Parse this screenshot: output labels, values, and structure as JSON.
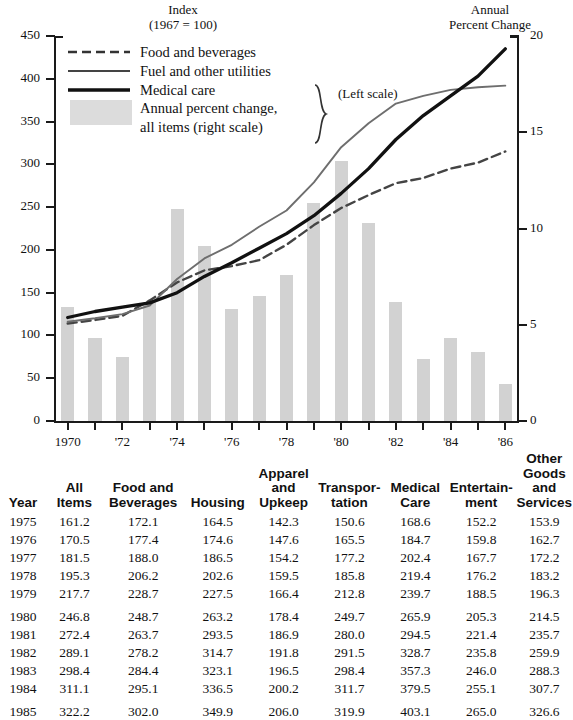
{
  "chart_data": {
    "type": "line",
    "title": "",
    "left_axis_title": "Index\n(1967 = 100)",
    "left_axis_title_line1": "Index",
    "left_axis_title_line2": "(1967 = 100)",
    "right_axis_title_line1": "Annual",
    "right_axis_title_line2": "Percent Change",
    "xlabel": "",
    "ylabel": "Index (1967 = 100)",
    "ylabel_right": "Annual Percent Change",
    "ylim": [
      0,
      450
    ],
    "ylim_right": [
      0,
      20
    ],
    "yticks": [
      0,
      50,
      100,
      150,
      200,
      250,
      300,
      350,
      400,
      450
    ],
    "yticks_right": [
      0,
      5,
      10,
      15,
      20
    ],
    "grid": false,
    "legend_position": "upper-left",
    "x": [
      1970,
      1971,
      1972,
      1973,
      1974,
      1975,
      1976,
      1977,
      1978,
      1979,
      1980,
      1981,
      1982,
      1983,
      1984,
      1985,
      1986
    ],
    "xtick_labels": [
      "1970",
      "",
      "'72",
      "",
      "'74",
      "",
      "'76",
      "",
      "'78",
      "",
      "'80",
      "",
      "'82",
      "",
      "'84",
      "",
      "'86"
    ],
    "series": [
      {
        "name": "Food and beverages",
        "style": "dashed",
        "color": "#444444",
        "scale": "left",
        "values": [
          114,
          118,
          123,
          141,
          162,
          176,
          181,
          188,
          206,
          229,
          249,
          264,
          278,
          284,
          295,
          302,
          315
        ]
      },
      {
        "name": "Fuel and other utilities",
        "style": "thin-solid",
        "color": "#6e6e6e",
        "scale": "left",
        "values": [
          116,
          120,
          125,
          135,
          166,
          190,
          206,
          227,
          246,
          279,
          320,
          348,
          371,
          380,
          387,
          390,
          392
        ]
      },
      {
        "name": "Medical care",
        "style": "thick-solid",
        "color": "#111111",
        "scale": "left",
        "values": [
          121,
          128,
          133,
          138,
          150,
          169,
          185,
          202,
          219,
          240,
          266,
          295,
          329,
          357,
          380,
          403,
          435
        ]
      },
      {
        "name": "Annual percent change, all items (right scale)",
        "style": "bar",
        "color": "#d2d2d2",
        "scale": "right",
        "values": [
          5.9,
          4.3,
          3.3,
          6.2,
          11.0,
          9.1,
          5.8,
          6.5,
          7.6,
          11.3,
          13.5,
          10.3,
          6.2,
          3.2,
          4.3,
          3.6,
          1.9
        ]
      }
    ],
    "legend": [
      {
        "label": "Food and beverages",
        "key": "dashed-line"
      },
      {
        "label": "Fuel and other utilities",
        "key": "thin-line"
      },
      {
        "label": "Medical care",
        "key": "thick-line"
      },
      {
        "label": "Annual percent change,",
        "key": "gray-swatch"
      },
      {
        "label": "all items (right scale)",
        "key": "gray-swatch-cont"
      }
    ],
    "legend_brace_label": "(Left scale)"
  },
  "table": {
    "headers": [
      "Year",
      "All\nItems",
      "Food and\nBeverages",
      "Housing",
      "Apparel\nand\nUpkeep",
      "Transpor-\ntation",
      "Medical\nCare",
      "Entertain-\nment",
      "Other\nGoods\nand Services"
    ],
    "headers_split": [
      [
        "",
        "",
        "Year"
      ],
      [
        "",
        "All",
        "Items"
      ],
      [
        "",
        "Food and",
        "Beverages"
      ],
      [
        "",
        "",
        "Housing"
      ],
      [
        "Apparel",
        "and",
        "Upkeep"
      ],
      [
        "",
        "Transpor-",
        "tation"
      ],
      [
        "",
        "Medical",
        "Care"
      ],
      [
        "",
        "Entertain-",
        "ment"
      ],
      [
        "Other",
        "Goods",
        "and Services"
      ]
    ],
    "rows": [
      [
        "1975",
        "161.2",
        "172.1",
        "164.5",
        "142.3",
        "150.6",
        "168.6",
        "152.2",
        "153.9"
      ],
      [
        "1976",
        "170.5",
        "177.4",
        "174.6",
        "147.6",
        "165.5",
        "184.7",
        "159.8",
        "162.7"
      ],
      [
        "1977",
        "181.5",
        "188.0",
        "186.5",
        "154.2",
        "177.2",
        "202.4",
        "167.7",
        "172.2"
      ],
      [
        "1978",
        "195.3",
        "206.2",
        "202.6",
        "159.5",
        "185.8",
        "219.4",
        "176.2",
        "183.2"
      ],
      [
        "1979",
        "217.7",
        "228.7",
        "227.5",
        "166.4",
        "212.8",
        "239.7",
        "188.5",
        "196.3"
      ],
      [
        "1980",
        "246.8",
        "248.7",
        "263.2",
        "178.4",
        "249.7",
        "265.9",
        "205.3",
        "214.5"
      ],
      [
        "1981",
        "272.4",
        "263.7",
        "293.5",
        "186.9",
        "280.0",
        "294.5",
        "221.4",
        "235.7"
      ],
      [
        "1982",
        "289.1",
        "278.2",
        "314.7",
        "191.8",
        "291.5",
        "328.7",
        "235.8",
        "259.9"
      ],
      [
        "1983",
        "298.4",
        "284.4",
        "323.1",
        "196.5",
        "298.4",
        "357.3",
        "246.0",
        "288.3"
      ],
      [
        "1984",
        "311.1",
        "295.1",
        "336.5",
        "200.2",
        "311.7",
        "379.5",
        "255.1",
        "307.7"
      ],
      [
        "1985",
        "322.2",
        "302.0",
        "349.9",
        "206.0",
        "319.9",
        "403.1",
        "265.0",
        "326.6"
      ]
    ]
  },
  "colors": {
    "bar_fill": "#d2d2d2",
    "axis": "#1a1a1a",
    "medical_care": "#111111",
    "fuel_utilities": "#6e6e6e",
    "food_beverages": "#444444"
  }
}
